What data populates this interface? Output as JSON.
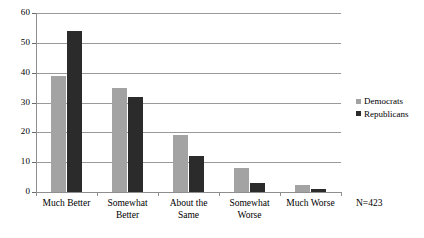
{
  "chart_data": {
    "type": "bar",
    "title": "",
    "subtitle": "",
    "xlabel": "",
    "ylabel": "",
    "ylim": [
      0,
      60
    ],
    "ytick_step": 10,
    "yticks": [
      "0",
      "10",
      "20",
      "30",
      "40",
      "50",
      "60"
    ],
    "grid": true,
    "legend_position": "right",
    "categories": [
      "Much Better",
      "Somewhat Better",
      "About the Same",
      "Somewhat Worse",
      "Much Worse"
    ],
    "category_lines": [
      [
        "Much Better"
      ],
      [
        "Somewhat",
        "Better"
      ],
      [
        "About the",
        "Same"
      ],
      [
        "Somewhat",
        "Worse"
      ],
      [
        "Much Worse"
      ]
    ],
    "series": [
      {
        "name": "Democrats",
        "color": "#a3a3a3",
        "values": [
          39,
          35,
          19,
          8,
          2.5
        ]
      },
      {
        "name": "Republicans",
        "color": "#2b2b2b",
        "values": [
          54,
          32,
          12,
          3,
          1
        ]
      }
    ],
    "annotations": [
      {
        "name": "sample-size",
        "text": "N=423"
      }
    ]
  },
  "legend": {
    "items": [
      {
        "label": "Democrats"
      },
      {
        "label": "Republicans"
      }
    ]
  },
  "annotation": {
    "sample_size": "N=423"
  },
  "colors": {
    "democrats": "#a3a3a3",
    "republicans": "#2b2b2b",
    "gridline": "#9a9a9a",
    "axis": "#8e8e8e",
    "background": "#ffffff"
  }
}
